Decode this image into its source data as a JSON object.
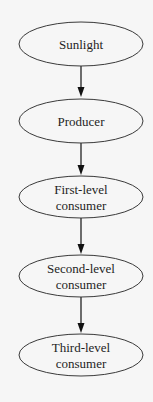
{
  "diagram": {
    "type": "flowchart",
    "direction": "top-to-bottom",
    "nodes": [
      {
        "id": "sunlight",
        "lines": [
          "Sunlight"
        ],
        "shape": "ellipse",
        "cx": 81,
        "cy": 44,
        "rx": 62,
        "ry": 22
      },
      {
        "id": "producer",
        "lines": [
          "Producer"
        ],
        "shape": "ellipse",
        "cx": 81,
        "cy": 121,
        "rx": 62,
        "ry": 22
      },
      {
        "id": "first-level-consumer",
        "lines": [
          "First-level",
          "consumer"
        ],
        "shape": "ellipse",
        "cx": 81,
        "cy": 197,
        "rx": 62,
        "ry": 21
      },
      {
        "id": "second-level-consumer",
        "lines": [
          "Second-level",
          "consumer"
        ],
        "shape": "ellipse",
        "cx": 81,
        "cy": 276,
        "rx": 62,
        "ry": 21
      },
      {
        "id": "third-level-consumer",
        "lines": [
          "Third-level",
          "consumer"
        ],
        "shape": "ellipse",
        "cx": 81,
        "cy": 355,
        "rx": 62,
        "ry": 21
      }
    ],
    "edges": [
      {
        "from": "sunlight",
        "to": "producer",
        "x": 81,
        "y1": 66,
        "y2": 98
      },
      {
        "from": "producer",
        "to": "first-level-consumer",
        "x": 81,
        "y1": 143,
        "y2": 176
      },
      {
        "from": "first-level-consumer",
        "to": "second-level-consumer",
        "x": 81,
        "y1": 218,
        "y2": 255
      },
      {
        "from": "second-level-consumer",
        "to": "third-level-consumer",
        "x": 81,
        "y1": 297,
        "y2": 334
      }
    ],
    "colors": {
      "background": "#f6f6f6",
      "stroke": "#3a3a3a",
      "arrow": "#111111",
      "text": "#1e1e1e"
    }
  }
}
